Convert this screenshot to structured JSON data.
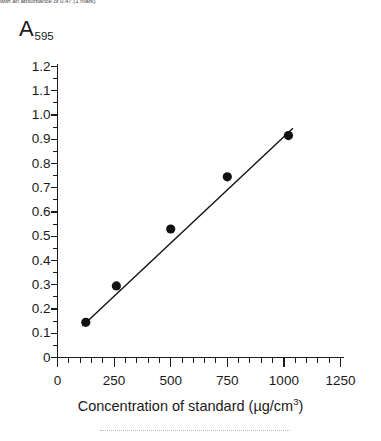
{
  "header": {
    "clipped_text": "with an absorbance of 0.47 (1 mark)"
  },
  "chart_data": {
    "type": "scatter",
    "title": "",
    "subtitle": "",
    "xlabel": "Concentration of standard (µg/cm³)",
    "xlabel_main": "Concentration of standard (µg/cm",
    "xlabel_sup": "3",
    "xlabel_close": ")",
    "ylabel": "A",
    "ylabel_subscript": "595",
    "xlim": [
      0,
      1250
    ],
    "ylim": [
      0,
      1.2
    ],
    "x_major_step": 250,
    "x_minor_step": 50,
    "y_major_step": 0.1,
    "y_minor_step": 0.05,
    "grid": false,
    "legend": null,
    "x_tick_labels": [
      "0",
      "250",
      "500",
      "750",
      "1000",
      "1250"
    ],
    "x_tick_values": [
      0,
      250,
      500,
      750,
      1000,
      1250
    ],
    "y_tick_labels": [
      "0",
      "0.1",
      "0.2",
      "0.3",
      "0.4",
      "0.5",
      "0.6",
      "0.7",
      "0.8",
      "0.9",
      "1.0",
      "1.1",
      "1.2"
    ],
    "y_tick_values": [
      0,
      0.1,
      0.2,
      0.3,
      0.4,
      0.5,
      0.6,
      0.7,
      0.8,
      0.9,
      1.0,
      1.1,
      1.2
    ],
    "series": [
      {
        "name": "standards",
        "marker": "filled-circle",
        "color": "#111111",
        "x": [
          125,
          260,
          500,
          750,
          1020
        ],
        "y": [
          0.145,
          0.295,
          0.53,
          0.745,
          0.915
        ]
      }
    ],
    "trendline": {
      "name": "line of best fit",
      "color": "#111111",
      "x": [
        110,
        1040
      ],
      "y": [
        0.13,
        0.945
      ]
    }
  }
}
